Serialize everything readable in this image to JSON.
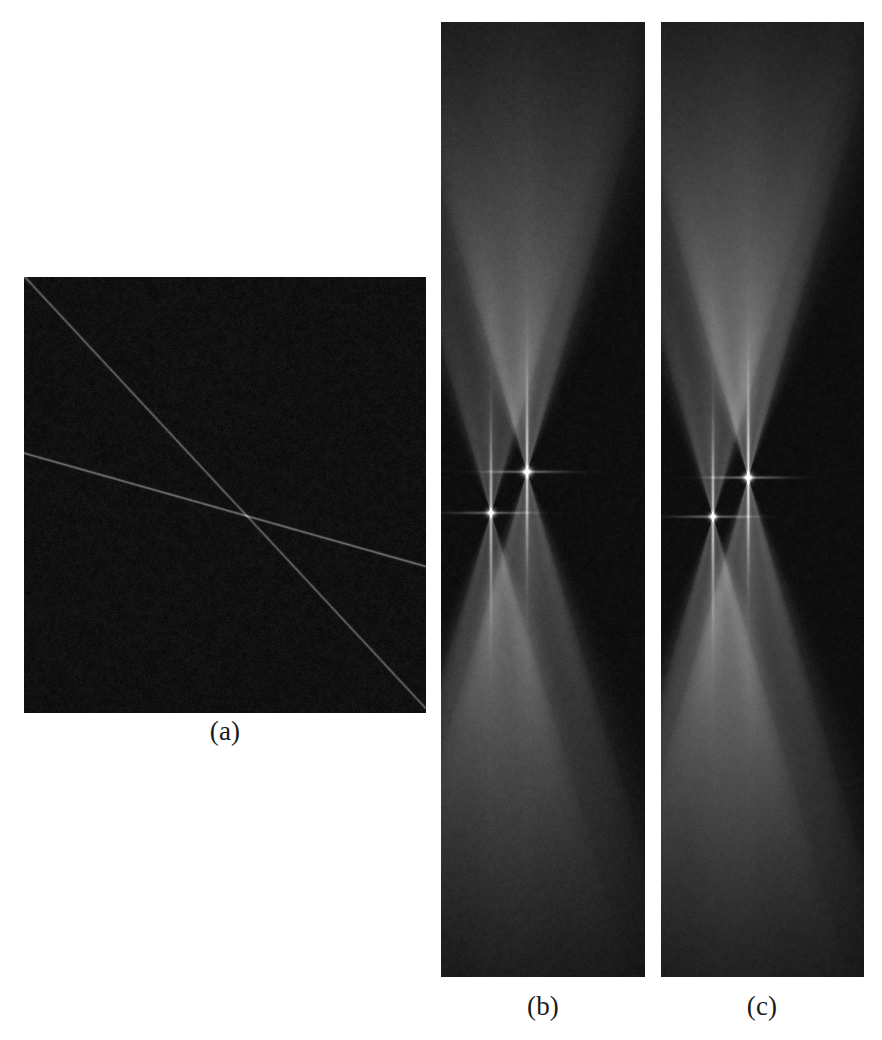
{
  "figure": {
    "background_color": "#ffffff",
    "label_color": "#1a1a1a",
    "panels": [
      {
        "id": "a",
        "label": "(a)",
        "kind": "image",
        "x": 24,
        "y": 277,
        "width": 402,
        "height": 436,
        "background_color": "#070707",
        "noise": {
          "amount": 0.26,
          "seed": 1471,
          "grain": 1
        },
        "lines": [
          {
            "name": "steep-line",
            "x0": 0.002,
            "y0": 0.0,
            "x1": 0.998,
            "y1": 0.988,
            "brightness": 0.52,
            "width": 1.15
          },
          {
            "name": "shallow-line",
            "x0": 0.0,
            "y0": 0.404,
            "x1": 1.0,
            "y1": 0.664,
            "brightness": 0.6,
            "width": 1.15
          }
        ],
        "crossing_point": {
          "x": 0.597,
          "y": 0.57
        }
      },
      {
        "id": "b",
        "label": "(b)",
        "kind": "transform",
        "x": 441,
        "y": 22,
        "width": 204,
        "height": 955,
        "background_color": "#060606",
        "noise": {
          "amount": 0.19,
          "seed": 2207,
          "grain": 1
        },
        "peaks": [
          {
            "name": "peak-left",
            "x": 0.245,
            "y": 0.514,
            "brightness": 0.86,
            "core": 3.0,
            "arm_halfangle": 0.3,
            "arm_reach": 0.62,
            "arm_brightness": 0.4
          },
          {
            "name": "peak-right",
            "x": 0.422,
            "y": 0.471,
            "brightness": 0.96,
            "core": 3.4,
            "arm_halfangle": 0.3,
            "arm_reach": 0.66,
            "arm_brightness": 0.44
          }
        ]
      },
      {
        "id": "c",
        "label": "(c)",
        "kind": "transform",
        "x": 661,
        "y": 22,
        "width": 203,
        "height": 955,
        "background_color": "#060606",
        "noise": {
          "amount": 0.17,
          "seed": 3313,
          "grain": 1
        },
        "peaks": [
          {
            "name": "peak-left",
            "x": 0.256,
            "y": 0.518,
            "brightness": 0.92,
            "core": 2.8,
            "arm_halfangle": 0.292,
            "arm_reach": 0.63,
            "arm_brightness": 0.42
          },
          {
            "name": "peak-right",
            "x": 0.43,
            "y": 0.477,
            "brightness": 1.0,
            "core": 3.2,
            "arm_halfangle": 0.292,
            "arm_reach": 0.67,
            "arm_brightness": 0.46
          }
        ]
      }
    ]
  },
  "chart_data": {
    "type": "heatmap",
    "title": "",
    "subtitle": "",
    "xlabel": "",
    "ylabel": "",
    "grid": false,
    "legend": "none",
    "annotations": [
      "(a)",
      "(b)",
      "(c)"
    ],
    "panels": [
      {
        "label": "(a)",
        "description": "Noisy grayscale input image containing two faint straight lines crossing near the image centre.",
        "size_px": [
          402,
          436
        ],
        "colormap": "gray",
        "features": [
          {
            "feature": "line",
            "name": "steep-line",
            "normalized_endpoints": [
              [
                0.002,
                0.0
              ],
              [
                0.998,
                0.988
              ]
            ],
            "slope_normalized": 0.992,
            "relative_intensity": 0.52
          },
          {
            "feature": "line",
            "name": "shallow-line",
            "normalized_endpoints": [
              [
                0.0,
                0.404
              ],
              [
                1.0,
                0.664
              ]
            ],
            "slope_normalized": 0.26,
            "relative_intensity": 0.6
          },
          {
            "feature": "crossing",
            "normalized_position": [
              0.597,
              0.57
            ]
          }
        ],
        "background_intensity": 0.03,
        "noise_level": 0.26
      },
      {
        "label": "(b)",
        "description": "Transform (accumulator) space of the input image showing two butterfly / bowtie responses, one per detected line.",
        "size_px": [
          204,
          955
        ],
        "colormap": "gray",
        "features": [
          {
            "feature": "butterfly-peak",
            "name": "peak-left",
            "normalized_position": [
              0.245,
              0.514
            ],
            "relative_intensity": 0.86
          },
          {
            "feature": "butterfly-peak",
            "name": "peak-right",
            "normalized_position": [
              0.422,
              0.471
            ],
            "relative_intensity": 0.96
          }
        ],
        "background_intensity": 0.025,
        "noise_level": 0.19
      },
      {
        "label": "(c)",
        "description": "Transform (accumulator) space variant with slightly sharper and brighter butterfly responses.",
        "size_px": [
          203,
          955
        ],
        "colormap": "gray",
        "features": [
          {
            "feature": "butterfly-peak",
            "name": "peak-left",
            "normalized_position": [
              0.256,
              0.518
            ],
            "relative_intensity": 0.92
          },
          {
            "feature": "butterfly-peak",
            "name": "peak-right",
            "normalized_position": [
              0.43,
              0.477
            ],
            "relative_intensity": 1.0
          }
        ],
        "background_intensity": 0.025,
        "noise_level": 0.17
      }
    ]
  }
}
